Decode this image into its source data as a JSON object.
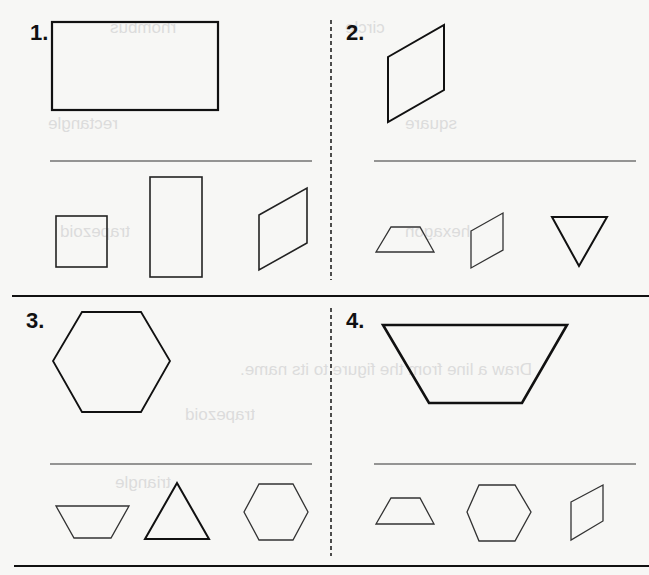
{
  "worksheet": {
    "problems": [
      {
        "number": "1.",
        "target_shape": "rectangle",
        "choices": [
          "square",
          "rectangle",
          "rhombus"
        ]
      },
      {
        "number": "2.",
        "target_shape": "rhombus",
        "choices": [
          "trapezoid",
          "rhombus",
          "triangle"
        ]
      },
      {
        "number": "3.",
        "target_shape": "hexagon",
        "choices": [
          "trapezoid",
          "triangle",
          "hexagon"
        ]
      },
      {
        "number": "4.",
        "target_shape": "trapezoid",
        "choices": [
          "trapezoid",
          "hexagon",
          "rhombus"
        ]
      }
    ],
    "bleed_through_text": [
      "rhombus",
      "circle",
      "rectangle",
      "square",
      "hexagon",
      "trapezoid",
      "Draw a line from the figure to its name.",
      "trapezoid",
      "triangle"
    ],
    "colors": {
      "paper": "#f7f7f5",
      "ink": "#111111",
      "ghost": "#dcdcdc"
    }
  }
}
